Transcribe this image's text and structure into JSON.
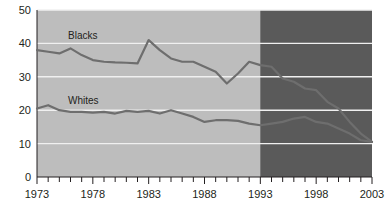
{
  "chart_data": {
    "type": "line",
    "title": "",
    "subtitle": "",
    "xlabel": "",
    "ylabel": "",
    "xlim": [
      1973,
      2003
    ],
    "ylim": [
      0,
      50
    ],
    "grid": true,
    "grid_axis": "y",
    "legend_position": "inline-annotation",
    "yticks": [
      "0",
      "10",
      "20",
      "30",
      "40",
      "50"
    ],
    "ytick_values": [
      0,
      10,
      20,
      30,
      40,
      50
    ],
    "xticks": [
      "1973",
      "1978",
      "1983",
      "1988",
      "1993",
      "1998",
      "2003"
    ],
    "xtick_values": [
      1973,
      1978,
      1983,
      1988,
      1993,
      1998,
      2003
    ],
    "xtick_minor_step": 1,
    "x": [
      1973,
      1974,
      1975,
      1976,
      1977,
      1978,
      1979,
      1980,
      1981,
      1982,
      1983,
      1984,
      1985,
      1986,
      1987,
      1988,
      1989,
      1990,
      1991,
      1992,
      1993,
      1994,
      1995,
      1996,
      1997,
      1998,
      1999,
      2000,
      2001,
      2002,
      2003
    ],
    "series": [
      {
        "name": "Blacks",
        "label": "Blacks",
        "color": "#6e6e6e",
        "values": [
          38.0,
          37.5,
          37.0,
          38.5,
          36.5,
          35.0,
          34.5,
          34.3,
          34.2,
          34.0,
          41.0,
          38.0,
          35.5,
          34.5,
          34.5,
          33.0,
          31.5,
          28.0,
          31.0,
          34.5,
          33.5,
          33.0,
          29.5,
          28.5,
          26.5,
          26.0,
          22.5,
          20.5,
          16.5,
          13.0,
          10.5
        ]
      },
      {
        "name": "Whites",
        "label": "Whites",
        "color": "#6e6e6e",
        "values": [
          20.5,
          21.5,
          20.0,
          19.5,
          19.5,
          19.3,
          19.5,
          19.0,
          19.8,
          19.5,
          19.8,
          19.0,
          20.0,
          19.0,
          18.0,
          16.5,
          17.0,
          17.0,
          16.8,
          16.0,
          15.5,
          16.0,
          16.5,
          17.5,
          18.0,
          16.5,
          16.0,
          14.5,
          13.0,
          11.0,
          10.5
        ]
      }
    ],
    "shaded_region": {
      "label": "",
      "x_start": 1993,
      "x_end": 2003,
      "color": "#5a5a5a"
    },
    "plot_background_color": "#bdbdbd",
    "gridline_color": "#f0f0f0"
  }
}
